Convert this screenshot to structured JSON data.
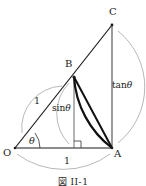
{
  "figure": {
    "caption": "図 II-1",
    "points": {
      "O": {
        "label": "O",
        "x": 15,
        "y": 148
      },
      "A": {
        "label": "A",
        "x": 112,
        "y": 148
      },
      "B": {
        "label": "B",
        "x": 74,
        "y": 77
      },
      "C": {
        "label": "C",
        "x": 112,
        "y": 25
      },
      "H": {
        "label": "",
        "x": 74,
        "y": 148
      }
    },
    "labels": {
      "point_o": "O",
      "point_a": "A",
      "point_b": "B",
      "point_c": "C",
      "radius_ob": "1",
      "base_oa": "1",
      "height_bh": "sin",
      "height_bh_arg": "θ",
      "tangent_ac": "tan",
      "tangent_ac_arg": "θ",
      "angle": "θ"
    },
    "geometry": {
      "radius": 97,
      "angle_degrees": 36.2,
      "right_angle_marker": true
    },
    "colors": {
      "stroke": "#1a1a1a",
      "thin_stroke": "#808080",
      "background": "#ffffff"
    }
  }
}
